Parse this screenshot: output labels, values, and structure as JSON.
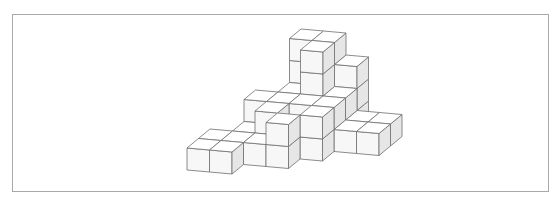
{
  "figure": {
    "type": "isometric-cube-stack",
    "stroke": "#6e6e6e",
    "faces": {
      "top": "#ffffff",
      "front": "#f7f7f7",
      "side": "#e6e6e6"
    },
    "projection": {
      "origin": [
        187,
        170
      ],
      "x_axis": [
        22.5,
        2
      ],
      "y_axis": [
        11.5,
        -9.5
      ],
      "z_axis": [
        0,
        -22
      ]
    },
    "cubes": [
      [
        0,
        0,
        0
      ],
      [
        1,
        0,
        0
      ],
      [
        0,
        1,
        0
      ],
      [
        1,
        1,
        0
      ],
      [
        2,
        1,
        0
      ],
      [
        3,
        1,
        0
      ],
      [
        3,
        1,
        1
      ],
      [
        1,
        2,
        0
      ],
      [
        2,
        2,
        0
      ],
      [
        3,
        2,
        0
      ],
      [
        4,
        2,
        0
      ],
      [
        4,
        2,
        1
      ],
      [
        2,
        2,
        1
      ],
      [
        1,
        3,
        0
      ],
      [
        2,
        3,
        0
      ],
      [
        3,
        3,
        0
      ],
      [
        4,
        3,
        0
      ],
      [
        5,
        3,
        0
      ],
      [
        6,
        3,
        0
      ],
      [
        1,
        3,
        1
      ],
      [
        2,
        3,
        1
      ],
      [
        3,
        3,
        1
      ],
      [
        4,
        3,
        1
      ],
      [
        2,
        4,
        0
      ],
      [
        3,
        4,
        0
      ],
      [
        4,
        4,
        0
      ],
      [
        5,
        4,
        0
      ],
      [
        6,
        4,
        0
      ],
      [
        2,
        4,
        1
      ],
      [
        3,
        4,
        1
      ],
      [
        4,
        4,
        1
      ],
      [
        3,
        4,
        2
      ],
      [
        3,
        4,
        3
      ],
      [
        3,
        5,
        0
      ],
      [
        4,
        5,
        0
      ],
      [
        3,
        5,
        1
      ],
      [
        4,
        5,
        1
      ],
      [
        3,
        5,
        2
      ],
      [
        3,
        5,
        3
      ],
      [
        2,
        5,
        2
      ],
      [
        2,
        5,
        3
      ],
      [
        4,
        5,
        2
      ]
    ]
  }
}
